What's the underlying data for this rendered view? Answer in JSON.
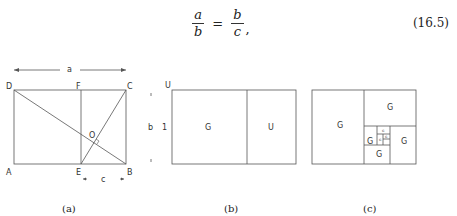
{
  "equation": {
    "lhs_numerator": "a",
    "lhs_denominator": "b",
    "operator": "=",
    "rhs_numerator": "b",
    "rhs_denominator": "c",
    "trailing": ",",
    "number": "(16.5)"
  },
  "figures": {
    "a": {
      "caption": "(a)",
      "points": {
        "A": "A",
        "B": "B",
        "C": "C",
        "D": "D",
        "E": "E",
        "F": "F",
        "O": "O"
      },
      "dim_top": "a",
      "dim_right": "b",
      "dim_bottom": "c"
    },
    "b": {
      "caption": "(b)",
      "corner_label": "U",
      "side_label": "1",
      "square_label": "G",
      "rect_label": "U"
    },
    "c": {
      "caption": "(c)",
      "labels": [
        "G",
        "G",
        "G",
        "G",
        "G",
        "G",
        "G",
        "G"
      ]
    }
  }
}
